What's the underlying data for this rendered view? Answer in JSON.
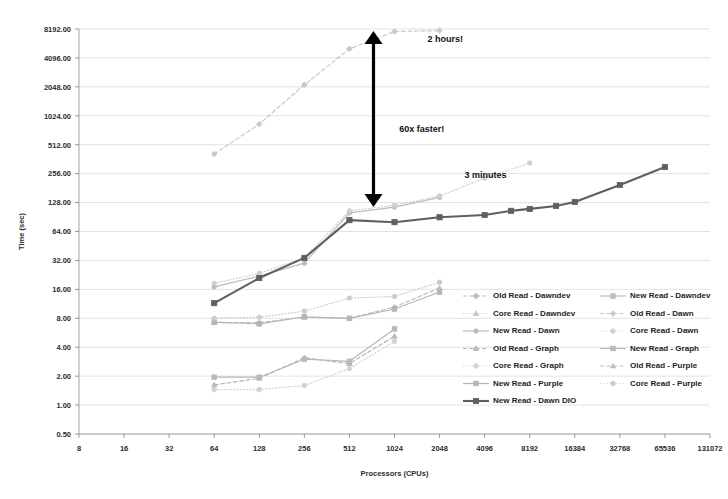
{
  "chart_data": {
    "type": "line",
    "title": "",
    "xlabel": "Processors (CPUs)",
    "ylabel": "Time (sec)",
    "xscale": "log2",
    "yscale": "log2",
    "xlim": [
      8,
      131072
    ],
    "ylim": [
      0.5,
      8192
    ],
    "grid": true,
    "legend_position": "inside-bottom-right",
    "xticks": [
      "8",
      "16",
      "32",
      "64",
      "128",
      "256",
      "512",
      "1024",
      "2048",
      "4096",
      "8192",
      "16384",
      "32768",
      "65536",
      "131072"
    ],
    "yticks": [
      "8192.00",
      "4096.00",
      "2048.00",
      "1024.00",
      "512.00",
      "256.00",
      "128.00",
      "64.00",
      "32.00",
      "16.00",
      "8.00",
      "4.00",
      "2.00",
      "1.00",
      "0.50"
    ],
    "annotations": [
      {
        "text": "2 hours!",
        "x": 1700,
        "y": 6000
      },
      {
        "text": "60x faster!",
        "x": 1100,
        "y": 700
      },
      {
        "text": "3 minutes",
        "x": 3000,
        "y": 230
      }
    ],
    "arrow": {
      "x": 1024,
      "y_top": 8192,
      "y_bottom": 110,
      "style": "double-headed"
    },
    "series": [
      {
        "name": "Old Read - Dawndev",
        "color": "#b9b9b9",
        "dash": "dashed",
        "marker": "diamond",
        "x": [],
        "values": []
      },
      {
        "name": "New Read - Dawndev",
        "color": "#bdbdbd",
        "dash": "solid",
        "marker": "square",
        "x": [],
        "values": []
      },
      {
        "name": "Core Read - Dawndev",
        "color": "#c4c4c4",
        "dash": "dotted",
        "marker": "triangle",
        "x": [],
        "values": []
      },
      {
        "name": "Old Read - Dawn",
        "color": "#c9c9c9",
        "dash": "dashed",
        "marker": "diamond",
        "x": [
          64,
          128,
          256,
          512,
          1024,
          2048
        ],
        "values": [
          410,
          840,
          2150,
          5100,
          7700,
          7900
        ]
      },
      {
        "name": "New Read - Dawn",
        "color": "#bcbcbc",
        "dash": "solid",
        "marker": "circle",
        "x": [
          64,
          128,
          256,
          512,
          1024,
          2048
        ],
        "values": [
          17.0,
          22.0,
          30.0,
          100.0,
          115.0,
          145.0
        ]
      },
      {
        "name": "Core Read - Dawn",
        "color": "#cfcfcf",
        "dash": "dotted",
        "marker": "circle",
        "x": [
          64,
          128,
          256,
          512,
          1024,
          2048,
          4096,
          8192
        ],
        "values": [
          18.5,
          23.5,
          34.0,
          105.0,
          120.0,
          150.0,
          230.0,
          330.0
        ]
      },
      {
        "name": "Old Read - Graph",
        "color": "#b5b5b5",
        "dash": "dashed",
        "marker": "triangle",
        "x": [
          64,
          128,
          256,
          512,
          1024
        ],
        "values": [
          1.62,
          1.9,
          3.1,
          2.7,
          5.2
        ]
      },
      {
        "name": "New Read - Graph",
        "color": "#b8b8b8",
        "dash": "solid",
        "marker": "square",
        "x": [
          64,
          128,
          256,
          512,
          1024
        ],
        "values": [
          1.95,
          1.95,
          3.0,
          2.85,
          6.2
        ]
      },
      {
        "name": "Core Read - Graph",
        "color": "#d2d2d2",
        "dash": "dotted",
        "marker": "circle",
        "x": [
          64,
          128,
          256,
          512,
          1024
        ],
        "values": [
          1.45,
          1.45,
          1.6,
          2.4,
          4.6
        ]
      },
      {
        "name": "Old Read - Purple",
        "color": "#c0c0c0",
        "dash": "dashed",
        "marker": "triangle",
        "x": [
          64,
          128,
          256,
          512,
          1024,
          2048
        ],
        "values": [
          7.2,
          7.2,
          8.2,
          8.0,
          10.5,
          16.5
        ]
      },
      {
        "name": "New Read - Purple",
        "color": "#b4b4b4",
        "dash": "solid",
        "marker": "square",
        "x": [
          64,
          128,
          256,
          512,
          1024,
          2048
        ],
        "values": [
          7.3,
          7.0,
          8.3,
          8.0,
          10.0,
          15.0
        ]
      },
      {
        "name": "Core Read - Purple",
        "color": "#cccccc",
        "dash": "dotted",
        "marker": "circle",
        "x": [
          64,
          128,
          256,
          512,
          1024,
          2048
        ],
        "values": [
          8.0,
          8.2,
          9.5,
          13.0,
          13.5,
          19.0
        ]
      },
      {
        "name": "New Read - Dawn DIO",
        "color": "#5f5f5f",
        "dash": "solid",
        "marker": "square",
        "x": [
          64,
          128,
          256,
          512,
          1024,
          2048,
          4096,
          6144,
          8192,
          12288,
          16384,
          32768,
          65536
        ],
        "values": [
          11.5,
          21.0,
          34.0,
          84.0,
          80.0,
          90.0,
          95.0,
          105.0,
          110.0,
          118.0,
          130.0,
          195.0,
          300.0
        ]
      }
    ]
  },
  "legend": {
    "entries": [
      {
        "label": "Old Read - Dawndev"
      },
      {
        "label": "New Read - Dawndev"
      },
      {
        "label": "Core Read - Dawndev"
      },
      {
        "label": "Old Read - Dawn"
      },
      {
        "label": "New Read - Dawn"
      },
      {
        "label": "Core Read - Dawn"
      },
      {
        "label": "Old Read - Graph"
      },
      {
        "label": "New Read - Graph"
      },
      {
        "label": "Core Read - Graph"
      },
      {
        "label": "Old Read - Purple"
      },
      {
        "label": "New Read - Purple"
      },
      {
        "label": "Core Read - Purple"
      },
      {
        "label": "New Read - Dawn DIO"
      }
    ]
  }
}
